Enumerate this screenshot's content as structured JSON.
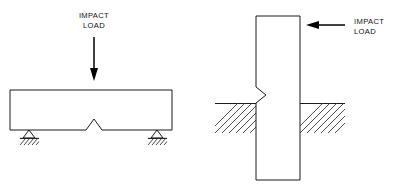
{
  "figure": {
    "background_color": "#ffffff",
    "line_color": "#1a1a1a",
    "panels": [
      {
        "id": "beam-panel",
        "name": "simply-supported-notched-beam",
        "label": {
          "line1": "IMPACT",
          "line2": "LOAD"
        },
        "load_direction": "down",
        "member": {
          "shape": "horizontal-beam",
          "x": 10,
          "y": 90,
          "width": 162,
          "height": 40
        },
        "notch": {
          "location": "bottom-edge-midspan",
          "shape": "v-notch-pointing-up",
          "width": 16,
          "depth": 11
        },
        "supports": [
          {
            "type": "pin-support-hatched",
            "x": 29,
            "y": 130
          },
          {
            "type": "pin-support-hatched",
            "x": 157,
            "y": 130
          }
        ],
        "arrow": {
          "from_x": 94,
          "from_y": 37,
          "to_x": 94,
          "to_y": 80
        }
      },
      {
        "id": "post-panel",
        "name": "embedded-notched-post",
        "label": {
          "line1": "IMPACT",
          "line2": "LOAD"
        },
        "load_direction": "left",
        "member": {
          "shape": "vertical-post",
          "x": 256,
          "y": 16,
          "width": 44,
          "height": 164
        },
        "notch": {
          "location": "left-edge-at-grade",
          "shape": "v-notch-pointing-right",
          "height": 16,
          "depth": 10
        },
        "ground": {
          "type": "hatched-soil",
          "surface_y": 103,
          "depth": 30,
          "left_block": {
            "x": 215,
            "width": 41
          },
          "right_block": {
            "x": 300,
            "width": 45
          }
        },
        "arrow": {
          "from_x": 345,
          "from_y": 25,
          "to_x": 307,
          "to_y": 25
        }
      }
    ]
  }
}
